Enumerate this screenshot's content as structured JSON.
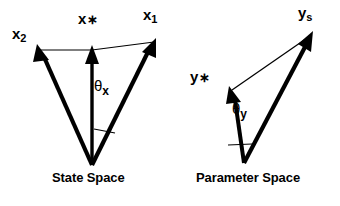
{
  "figure": {
    "type": "diagram",
    "title_visible": false,
    "background_color": "#ffffff",
    "stroke_color": "#000000",
    "panels": [
      {
        "name": "state-space",
        "caption": "State Space",
        "origin": [
          92,
          165
        ],
        "vectors": [
          {
            "name": "x2",
            "label": "x",
            "subscript": "2",
            "star": false,
            "tip": [
              38,
              48
            ],
            "style": "thick"
          },
          {
            "name": "xstar",
            "label": "x",
            "subscript": "",
            "star": true,
            "tip": [
              92,
              48
            ],
            "style": "thick"
          },
          {
            "name": "x1",
            "label": "x",
            "subscript": "1",
            "star": false,
            "tip": [
              155,
              40
            ],
            "style": "thick"
          }
        ],
        "tip_connector": {
          "from": [
            38,
            48
          ],
          "via": [
            92,
            48
          ],
          "to": [
            155,
            40
          ],
          "style": "thin"
        },
        "angle": {
          "label": "θ",
          "subscript": "x",
          "between": [
            "xstar",
            "x1"
          ],
          "marker": "thin-line"
        }
      },
      {
        "name": "parameter-space",
        "caption": "Parameter Space",
        "origin": [
          244,
          163
        ],
        "vectors": [
          {
            "name": "ystar",
            "label": "y",
            "subscript": "",
            "star": true,
            "tip": [
              230,
              88
            ],
            "style": "thick"
          },
          {
            "name": "ys",
            "label": "y",
            "subscript": "s",
            "star": false,
            "tip": [
              312,
              33
            ],
            "style": "thick"
          }
        ],
        "tip_connector": {
          "from": [
            230,
            88
          ],
          "to": [
            312,
            33
          ],
          "style": "thin"
        },
        "angle": {
          "label": "θ",
          "subscript": "y",
          "between": [
            "ystar",
            "ys"
          ],
          "marker": "thin-line"
        }
      }
    ]
  },
  "labels": {
    "x2": {
      "base": "x",
      "sub": "2",
      "star": ""
    },
    "xstar": {
      "base": "x",
      "sub": "",
      "star": "∗"
    },
    "x1": {
      "base": "x",
      "sub": "1",
      "star": ""
    },
    "theta_x": {
      "base": "θ",
      "sub": "x"
    },
    "ystar": {
      "base": "y",
      "sub": "",
      "star": "∗"
    },
    "ys": {
      "base": "y",
      "sub": "s",
      "star": ""
    },
    "theta_y": {
      "base": "θ",
      "sub": "y"
    }
  },
  "captions": {
    "state_space": "State Space",
    "parameter_space": "Parameter Space"
  }
}
